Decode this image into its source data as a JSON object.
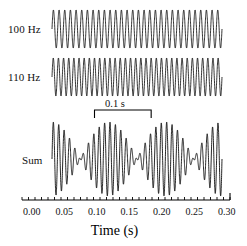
{
  "figure": {
    "traces": [
      {
        "key": "t100",
        "label": "100 Hz"
      },
      {
        "key": "t110",
        "label": "110 Hz"
      },
      {
        "key": "tsum",
        "label": "Sum"
      }
    ],
    "annotation": {
      "label": "0.1 s",
      "x_start": 0.075,
      "x_end": 0.175
    },
    "line_color": "#000000"
  },
  "axis": {
    "title": "Time (s)",
    "tick_labels": [
      "0.00",
      "0.05",
      "0.10",
      "0.15",
      "0.20",
      "0.25",
      "0.30"
    ],
    "major_ticks": [
      0.0,
      0.05,
      0.1,
      0.15,
      0.2,
      0.25,
      0.3
    ],
    "minor_tick_step": 0.01,
    "axis_start": -0.015,
    "axis_end": 0.305
  },
  "chart_data": {
    "type": "line",
    "title": "",
    "xlabel": "Time (s)",
    "ylabel": "",
    "xlim": [
      -0.015,
      0.305
    ],
    "grid": false,
    "legend": "none",
    "x_tick_labels": [
      "0.00",
      "0.05",
      "0.10",
      "0.15",
      "0.20",
      "0.25",
      "0.30"
    ],
    "x_ticks_major": [
      0.0,
      0.05,
      0.1,
      0.15,
      0.2,
      0.25,
      0.3
    ],
    "x_ticks_minor_step": 0.01,
    "annotations": [
      {
        "text": "0.1 s",
        "type": "span-bracket",
        "x_start": 0.075,
        "x_end": 0.175
      }
    ],
    "series": [
      {
        "name": "100 Hz",
        "type": "sine",
        "frequency_hz": 100,
        "amplitude": 1,
        "phase_rad": 0,
        "x_start": 0.0,
        "x_end": 0.3,
        "samples": 2400
      },
      {
        "name": "110 Hz",
        "type": "sine",
        "frequency_hz": 110,
        "amplitude": 1,
        "phase_rad": 0,
        "x_start": 0.0,
        "x_end": 0.3,
        "samples": 2400
      },
      {
        "name": "Sum",
        "type": "sum-of-sines",
        "components": [
          {
            "frequency_hz": 100,
            "amplitude": 1,
            "phase_rad": 0
          },
          {
            "frequency_hz": 110,
            "amplitude": 1,
            "phase_rad": 0
          }
        ],
        "beat_frequency_hz": 10,
        "amplitude": 2,
        "x_start": 0.0,
        "x_end": 0.3,
        "samples": 3000
      }
    ]
  },
  "geometry": {
    "plot_x_left": 52,
    "plot_x_right": 222,
    "trace_bands": {
      "t100": {
        "top": 10,
        "bottom": 48
      },
      "t110": {
        "top": 58,
        "bottom": 96
      },
      "tsum": {
        "top": 122,
        "bottom": 196
      }
    },
    "axis_y": 200,
    "axis_px_start": 22,
    "axis_px_end": 230,
    "major_tick_len": 7,
    "minor_tick_len": 3
  }
}
